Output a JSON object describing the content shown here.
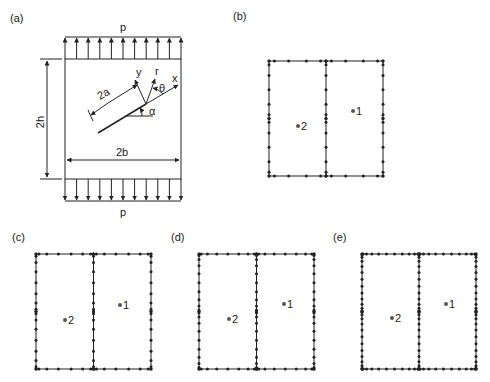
{
  "figure": {
    "panels": [
      {
        "id": "a",
        "label": "(a)",
        "type": "geometry",
        "load_top": "p",
        "load_bottom": "p",
        "height_dim": "2h",
        "width_dim": "2b",
        "crack_dim": "2a",
        "axes": {
          "x": "x",
          "y": "y",
          "r": "r",
          "theta": "θ",
          "alpha": "α"
        }
      },
      {
        "id": "b",
        "label": "(b)",
        "type": "mesh",
        "subregion_1": "1",
        "subregion_2": "2",
        "density": "coarse"
      },
      {
        "id": "c",
        "label": "(c)",
        "type": "mesh",
        "subregion_1": "1",
        "subregion_2": "2",
        "density": "medium"
      },
      {
        "id": "d",
        "label": "(d)",
        "type": "mesh",
        "subregion_1": "1",
        "subregion_2": "2",
        "density": "fine"
      },
      {
        "id": "e",
        "label": "(e)",
        "type": "mesh",
        "subregion_1": "1",
        "subregion_2": "2",
        "density": "finest"
      }
    ]
  }
}
